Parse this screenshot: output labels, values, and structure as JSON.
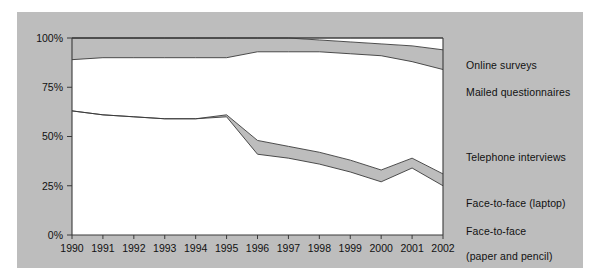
{
  "chart_data": {
    "type": "area",
    "stacked": true,
    "title": "",
    "xlabel": "",
    "ylabel": "",
    "x": [
      1990,
      1991,
      1992,
      1993,
      1994,
      1995,
      1996,
      1997,
      1998,
      1999,
      2000,
      2001,
      2002
    ],
    "categories": [
      "1990",
      "1991",
      "1992",
      "1993",
      "1994",
      "1995",
      "1996",
      "1997",
      "1998",
      "1999",
      "2000",
      "2001",
      "2002"
    ],
    "xlim": [
      1990,
      2002
    ],
    "ylim": [
      0,
      100
    ],
    "yticks": [
      0,
      25,
      50,
      75,
      100
    ],
    "ytick_labels": [
      "0%",
      "25%",
      "50%",
      "75%",
      "100%"
    ],
    "grid": false,
    "legend_position": "right",
    "unit": "%",
    "series": [
      {
        "name": "Face-to-face (paper and pencil)",
        "color": "#ffffff",
        "values": [
          63,
          61,
          60,
          59,
          59,
          60,
          41,
          39,
          36,
          32,
          27,
          34,
          25
        ]
      },
      {
        "name": "Face-to-face (laptop)",
        "color": "#bdbdbd",
        "values": [
          0,
          0,
          0,
          0,
          0,
          1,
          7,
          6,
          6,
          6,
          6,
          5,
          6
        ]
      },
      {
        "name": "Telephone interviews",
        "color": "#ffffff",
        "values": [
          26,
          29,
          30,
          31,
          31,
          29,
          45,
          48,
          51,
          54,
          58,
          49,
          53
        ]
      },
      {
        "name": "Mailed questionnaires",
        "color": "#bdbdbd",
        "values": [
          11,
          10,
          10,
          10,
          10,
          10,
          7,
          7,
          6,
          6,
          6,
          8,
          10
        ]
      },
      {
        "name": "Online surveys",
        "color": "#ffffff",
        "values": [
          0,
          0,
          0,
          0,
          0,
          0,
          0,
          0,
          1,
          2,
          3,
          4,
          6
        ]
      }
    ],
    "boundaries_cumulative_percent": {
      "face_to_face_paper": [
        63,
        61,
        60,
        59,
        59,
        60,
        41,
        39,
        36,
        32,
        27,
        34,
        25
      ],
      "plus_face_to_face_laptop": [
        63,
        61,
        60,
        59,
        59,
        61,
        48,
        45,
        42,
        38,
        33,
        39,
        31
      ],
      "plus_telephone": [
        89,
        90,
        90,
        90,
        90,
        90,
        93,
        93,
        93,
        92,
        91,
        88,
        84
      ],
      "plus_mailed": [
        100,
        100,
        100,
        100,
        100,
        100,
        100,
        100,
        99,
        98,
        97,
        96,
        94
      ],
      "top": [
        100,
        100,
        100,
        100,
        100,
        100,
        100,
        100,
        100,
        100,
        100,
        100,
        100
      ]
    }
  },
  "legend": {
    "items": [
      {
        "label": "Online surveys",
        "line2": ""
      },
      {
        "label": "Mailed questionnaires",
        "line2": ""
      },
      {
        "label": "Telephone interviews",
        "line2": ""
      },
      {
        "label": "Face-to-face (laptop)",
        "line2": ""
      },
      {
        "label": "Face-to-face",
        "line2": "(paper and pencil)"
      }
    ]
  },
  "axis": {
    "y_labels": [
      "100%",
      "75%",
      "50%",
      "25%",
      "0%"
    ],
    "x_labels": [
      "1990",
      "1991",
      "1992",
      "1993",
      "1994",
      "1995",
      "1996",
      "1997",
      "1998",
      "1999",
      "2000",
      "2001",
      "2002"
    ]
  },
  "colors": {
    "panel_background": "#bdbdbd",
    "plot_fill": "#ffffff",
    "band_fill": "#bdbdbd",
    "line": "#3a3a3a",
    "text": "#111111",
    "page_background": "#ffffff"
  }
}
